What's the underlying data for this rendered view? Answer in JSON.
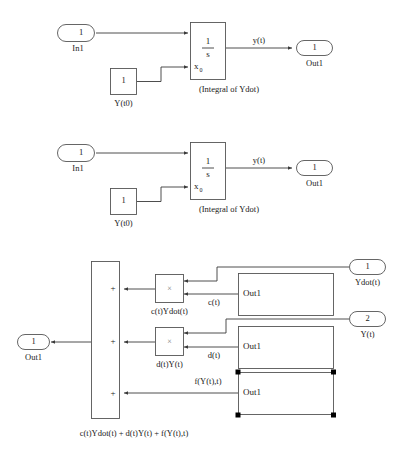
{
  "document": {
    "title": "Simulink Block Diagram Figure",
    "background_color": "#ffffff",
    "line_color": "#555555",
    "wire_color": "#3a3a3a",
    "text_color": "#1a1a1a",
    "handle_color": "#000000"
  },
  "diagrams": [
    {
      "id": "integrator-diagram-top",
      "inport": {
        "number": "1",
        "label": "In1"
      },
      "const_block": {
        "value": "1",
        "label": "Y(t0)"
      },
      "integrator": {
        "numerator": "1",
        "denominator": "s",
        "ic_port_label": "x",
        "ic_port_sub": "0",
        "caption": "(Integral of Ydot)"
      },
      "signal_label": "y(t)",
      "outport": {
        "number": "1",
        "label": "Out1"
      }
    },
    {
      "id": "integrator-diagram-middle",
      "inport": {
        "number": "1",
        "label": "In1"
      },
      "const_block": {
        "value": "1",
        "label": "Y(t0)"
      },
      "integrator": {
        "numerator": "1",
        "denominator": "s",
        "ic_port_label": "x",
        "ic_port_sub": "0",
        "caption": "(Integral of Ydot)"
      },
      "signal_label": "y(t)",
      "outport": {
        "number": "1",
        "label": "Out1"
      }
    }
  ],
  "sum_diagram": {
    "id": "summation-diagram-bottom",
    "sum_block": {
      "signs": [
        "+",
        "+",
        "+"
      ]
    },
    "outport": {
      "number": "1",
      "label": "Out1"
    },
    "product_blocks": [
      {
        "symbol": "×",
        "label": "c(t)Ydot(t)"
      },
      {
        "symbol": "×",
        "label": "d(t)Y(t)"
      }
    ],
    "subsystems": [
      {
        "out_label": "Out1",
        "signal": "c(t)",
        "selected": false
      },
      {
        "out_label": "Out1",
        "signal": "d(t)",
        "selected": false
      },
      {
        "out_label": "Out1",
        "signal": "f(Y(t),t)",
        "selected": true
      }
    ],
    "inports": [
      {
        "number": "1",
        "label": "Ydot(t)"
      },
      {
        "number": "2",
        "label": "Y(t)"
      }
    ],
    "caption": "c(t)Ydot(t) + d(t)Y(t) + f(Y(t),t)"
  }
}
